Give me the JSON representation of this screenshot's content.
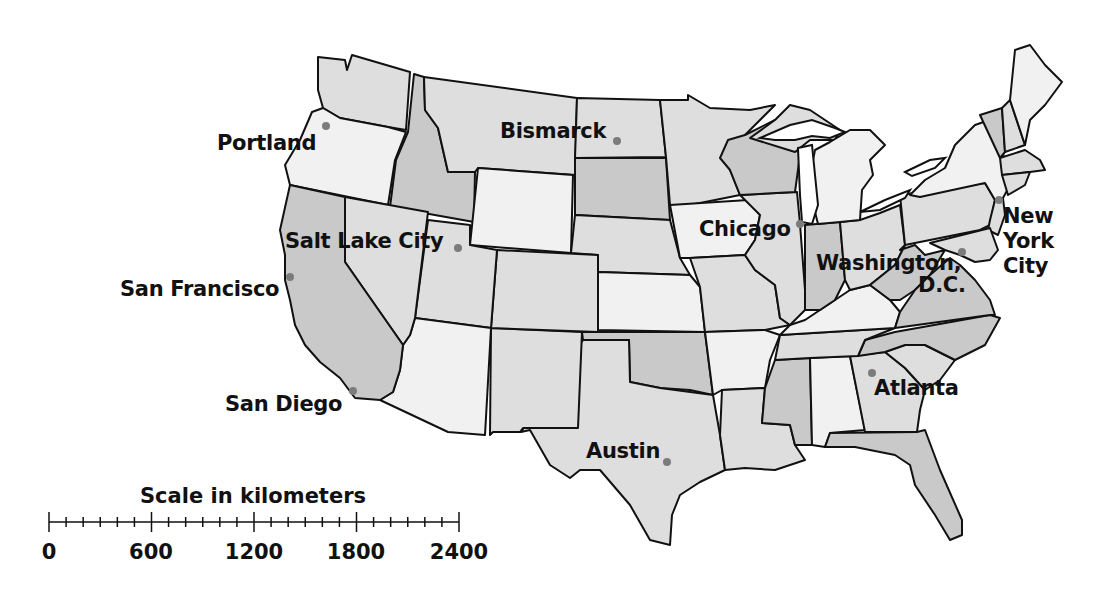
{
  "map": {
    "title": "United States of America",
    "cities": [
      {
        "name": "Portland",
        "label": "Portland",
        "dot": [
          326,
          126
        ]
      },
      {
        "name": "Bismarck",
        "label": "Bismarck",
        "dot": [
          617,
          141
        ]
      },
      {
        "name": "Salt Lake City",
        "label": "Salt Lake City",
        "dot": [
          458,
          248
        ]
      },
      {
        "name": "San Francisco",
        "label": "San Francisco",
        "dot": [
          290,
          277
        ]
      },
      {
        "name": "San Diego",
        "label": "San Diego",
        "dot": [
          353,
          391
        ]
      },
      {
        "name": "Chicago",
        "label": "Chicago",
        "dot": [
          800,
          224
        ]
      },
      {
        "name": "Washington, D.C.",
        "label_line1": "Washington,",
        "label_line2": "D.C.",
        "dot": [
          962,
          252
        ]
      },
      {
        "name": "New York City",
        "label_line1": "New",
        "label_line2": "York",
        "label_line3": "City",
        "dot": [
          999,
          200
        ]
      },
      {
        "name": "Atlanta",
        "label": "Atlanta",
        "dot": [
          872,
          373
        ]
      },
      {
        "name": "Austin",
        "label": "Austin",
        "dot": [
          667,
          462
        ]
      }
    ],
    "colors": {
      "light": "#f1f1f1",
      "medium": "#dedede",
      "dark": "#c9c9c9",
      "border": "#111111",
      "city_dot": "#7c7c7c"
    }
  },
  "scale": {
    "title": "Scale in kilometers",
    "unit": "kilometers",
    "ticks": [
      "0",
      "600",
      "1200",
      "1800",
      "2400"
    ],
    "minor_per_major": 6
  }
}
